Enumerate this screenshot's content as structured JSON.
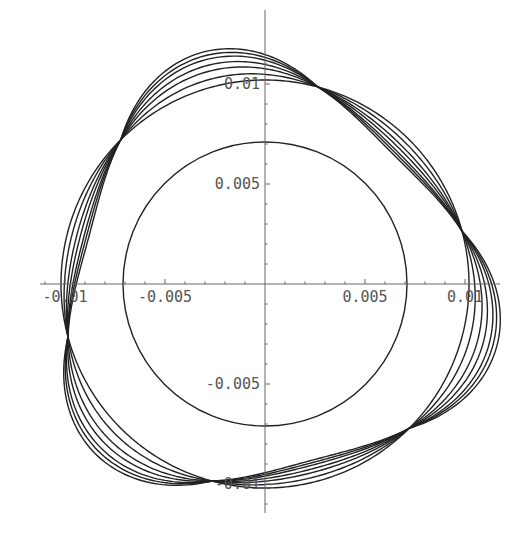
{
  "chart_data": {
    "type": "line",
    "title": "",
    "xlabel": "",
    "ylabel": "",
    "xlim": [
      -0.0113,
      0.0118
    ],
    "ylim": [
      -0.0127,
      0.0138
    ],
    "grid": false,
    "legend": null,
    "x_ticks": [
      {
        "value": -0.01,
        "label": "-0.01"
      },
      {
        "value": -0.005,
        "label": "-0.005"
      },
      {
        "value": 0.005,
        "label": "0.005"
      },
      {
        "value": 0.01,
        "label": "0.01"
      }
    ],
    "y_ticks": [
      {
        "value": 0.01,
        "label": "0.01"
      },
      {
        "value": 0.005,
        "label": "0.005"
      },
      {
        "value": -0.005,
        "label": "-0.005"
      },
      {
        "value": -0.01,
        "label": "-0.01"
      }
    ],
    "minor_tick_step": 0.001,
    "inner_circle": {
      "radius": 0.0071
    },
    "reference_circle": {
      "radius": 0.0102
    },
    "lobed_curves": {
      "description": "Closed curves r(theta) = R + a*cos(3*(theta - phase)), all passing through 6 common nodes",
      "base_radius": 0.0102,
      "phase_deg": 105,
      "lobes": 3,
      "amplitudes": [
        0.0,
        0.0004,
        0.0008,
        0.0011,
        0.0014,
        0.0016,
        0.0018
      ],
      "inward_scale": 0.6,
      "node_angles_deg": [
        15,
        75,
        135,
        195,
        255,
        315
      ]
    },
    "node_points": [
      [
        0.00215,
        0.0101
      ],
      [
        0.00985,
        0.0021
      ],
      [
        0.00725,
        -0.0073
      ],
      [
        -0.0016,
        -0.0103
      ],
      [
        -0.01,
        -0.00215
      ],
      [
        -0.0079,
        0.00685
      ]
    ]
  },
  "layout": {
    "origin_px": [
      265,
      284
    ],
    "px_per_unit": 20000,
    "x_axis_px": [
      40,
      500
    ],
    "y_axis_px": [
      10,
      513
    ]
  }
}
